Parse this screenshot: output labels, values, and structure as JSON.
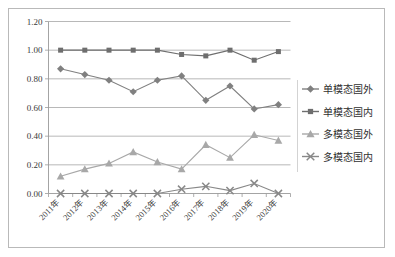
{
  "chart_data": {
    "type": "line",
    "title": "",
    "subtitle": "",
    "xlabel": "",
    "ylabel": "",
    "grid": true,
    "legend_position": "right",
    "ylim": [
      0.0,
      1.2
    ],
    "ytick_values": [
      0.0,
      0.2,
      0.4,
      0.6,
      0.8,
      1.0,
      1.2
    ],
    "ytick_labels": [
      "0.00",
      "0.20",
      "0.40",
      "0.60",
      "0.80",
      "1.00",
      "1.20"
    ],
    "categories": [
      "2011年",
      "2012年",
      "2013年",
      "2014年",
      "2015年",
      "2016年",
      "2017年",
      "2018年",
      "2019年",
      "2020年"
    ],
    "series": [
      {
        "name": "单模态国外",
        "marker": "diamond",
        "color": "#808080",
        "values": [
          0.87,
          0.83,
          0.79,
          0.71,
          0.79,
          0.82,
          0.65,
          0.75,
          0.59,
          0.62
        ]
      },
      {
        "name": "单模态国内",
        "marker": "square",
        "color": "#6e6e6e",
        "values": [
          1.0,
          1.0,
          1.0,
          1.0,
          1.0,
          0.97,
          0.96,
          1.0,
          0.93,
          0.99
        ]
      },
      {
        "name": "多模态国外",
        "marker": "triangle",
        "color": "#a8a8a8",
        "values": [
          0.12,
          0.17,
          0.21,
          0.29,
          0.22,
          0.17,
          0.34,
          0.25,
          0.41,
          0.37
        ]
      },
      {
        "name": "多模态国内",
        "marker": "cross",
        "color": "#888888",
        "values": [
          0.0,
          0.0,
          0.0,
          0.0,
          0.0,
          0.03,
          0.05,
          0.02,
          0.07,
          0.0
        ]
      }
    ]
  },
  "legend": {
    "items": [
      {
        "label": "单模态国外",
        "marker": "diamond",
        "color": "#808080"
      },
      {
        "label": "单模态国内",
        "marker": "square",
        "color": "#6e6e6e"
      },
      {
        "label": "多模态国外",
        "marker": "triangle",
        "color": "#a8a8a8"
      },
      {
        "label": "多模态国内",
        "marker": "cross",
        "color": "#888888"
      }
    ]
  },
  "colors": {
    "plot_background": "#ffffff",
    "border": "#b9b9b9",
    "gridline": "#a6a6a6",
    "axis": "#9a9a9a"
  }
}
